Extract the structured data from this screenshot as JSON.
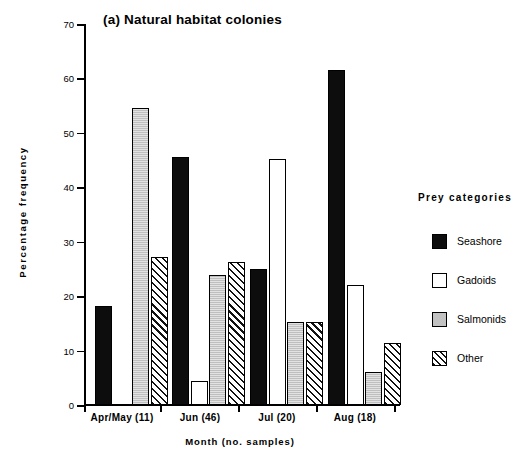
{
  "chart_data": {
    "type": "bar",
    "title": "(a) Natural habitat colonies",
    "xlabel": "Month  (no. samples)",
    "ylabel": "Percentage  frequency",
    "ylim": [
      0,
      70
    ],
    "ytick_step": 10,
    "yticks": [
      0,
      10,
      20,
      30,
      40,
      50,
      60,
      70
    ],
    "grid": false,
    "legend_position": "right",
    "legend_title": "Prey  categories",
    "categories": [
      "Apr/May   (11)",
      "Jun   (46)",
      "Jul   (20)",
      "Aug   (18)"
    ],
    "category_months": [
      "Apr/May",
      "Jun",
      "Jul",
      "Aug"
    ],
    "category_samples": [
      "(11)",
      "(46)",
      "(20)",
      "(18)"
    ],
    "series": [
      {
        "name": "Seashore",
        "fill": "solid-black",
        "values": [
          18.2,
          45.5,
          25.0,
          61.5
        ]
      },
      {
        "name": "Gadoids",
        "fill": "white",
        "values": [
          0,
          4.5,
          45.2,
          22.1
        ]
      },
      {
        "name": "Salmonids",
        "fill": "gray",
        "values": [
          54.5,
          23.9,
          15.2,
          6.1
        ]
      },
      {
        "name": "Other",
        "fill": "hatched",
        "values": [
          27.2,
          26.2,
          15.2,
          11.4
        ]
      }
    ]
  },
  "legend": {
    "title": "Prey  categories",
    "items": [
      {
        "label": "Seashore"
      },
      {
        "label": "Gadoids"
      },
      {
        "label": "Salmonids"
      },
      {
        "label": "Other"
      }
    ]
  },
  "axes": {
    "y_title": "Percentage  frequency",
    "x_title": "Month  (no. samples)",
    "y_ticks": [
      "0",
      "10",
      "20",
      "30",
      "40",
      "50",
      "60",
      "70"
    ]
  }
}
